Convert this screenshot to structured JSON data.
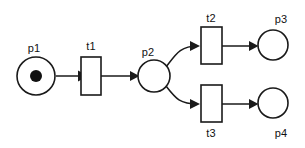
{
  "diagram": {
    "type": "petri-net",
    "background_color": "#ffffff",
    "stroke_color": "#1a1a1a",
    "token_color": "#111111",
    "places": [
      {
        "id": "p1",
        "label": "p1",
        "cx": 36,
        "cy": 76,
        "r": 19,
        "tokens": 1,
        "token_r": 6,
        "label_x": 34,
        "label_y": 52,
        "label_anchor": "middle"
      },
      {
        "id": "p2",
        "label": "p2",
        "cx": 154,
        "cy": 76,
        "r": 16,
        "tokens": 0,
        "token_r": 0,
        "label_x": 148,
        "label_y": 56,
        "label_anchor": "middle"
      },
      {
        "id": "p3",
        "label": "p3",
        "cx": 273,
        "cy": 45,
        "r": 15,
        "tokens": 0,
        "token_r": 0,
        "label_x": 281,
        "label_y": 23,
        "label_anchor": "middle"
      },
      {
        "id": "p4",
        "label": "p4",
        "cx": 273,
        "cy": 103,
        "r": 15,
        "tokens": 0,
        "token_r": 0,
        "label_x": 281,
        "label_y": 137,
        "label_anchor": "middle"
      }
    ],
    "transitions": [
      {
        "id": "t1",
        "label": "t1",
        "x": 81,
        "y": 57,
        "width": 20,
        "height": 38,
        "label_x": 91,
        "label_y": 50,
        "label_position": "above"
      },
      {
        "id": "t2",
        "label": "t2",
        "x": 201,
        "y": 27,
        "width": 21,
        "height": 37,
        "label_x": 211,
        "label_y": 22,
        "label_position": "above"
      },
      {
        "id": "t3",
        "label": "t3",
        "x": 201,
        "y": 85,
        "width": 21,
        "height": 37,
        "label_x": 211,
        "label_y": 137,
        "label_position": "below"
      }
    ],
    "arcs": [
      {
        "id": "arc-p1-t1",
        "from": "p1",
        "to": "t1",
        "path": "M 56 76 L 78 76",
        "arrow_points": "78,70.5 78,81.5 88,76",
        "curved": false
      },
      {
        "id": "arc-t1-p2",
        "from": "t1",
        "to": "p2",
        "path": "M 101 76 L 135 76",
        "arrow_points": "130,71 130,81 139.5,76",
        "curved": false
      },
      {
        "id": "arc-p2-t2",
        "from": "p2",
        "to": "t2",
        "path": "M 166 67 C 176 54, 180 46, 198 46",
        "arrow_points": "190,41 190,51 200,46",
        "curved": true
      },
      {
        "id": "arc-p2-t3",
        "from": "p2",
        "to": "t3",
        "path": "M 166 86 C 176 99, 180 104, 198 104",
        "arrow_points": "190,99 190,109 200,104",
        "curved": true
      },
      {
        "id": "arc-t2-p3",
        "from": "t2",
        "to": "p3",
        "path": "M 222 46 L 255 46",
        "arrow_points": "249,41 249,51 258.5,46",
        "curved": false
      },
      {
        "id": "arc-t3-p4",
        "from": "t3",
        "to": "p4",
        "path": "M 222 104 L 255 104",
        "arrow_points": "249,99 249,109 258.5,104",
        "curved": false
      }
    ]
  }
}
